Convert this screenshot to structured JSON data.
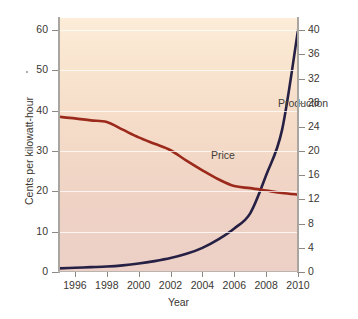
{
  "chart_data": {
    "type": "line",
    "title": "",
    "subtitle": "",
    "xlabel": "Year",
    "ylabel": "Cents per kilowatt-hour",
    "y2label": "Global solar power capacity (gigawatts)",
    "grid": "horizontal",
    "legend_position": "inline-annotation",
    "xlim": [
      1995,
      2010
    ],
    "ylim": [
      0,
      63
    ],
    "y2lim": [
      0,
      42
    ],
    "xticks": [
      1996,
      1998,
      2000,
      2002,
      2004,
      2006,
      2008,
      2010
    ],
    "xtick_labels": [
      "1996",
      "1998",
      "2000",
      "2002",
      "2004",
      "2006",
      "2008",
      "2010"
    ],
    "yticks": [
      0,
      10,
      20,
      30,
      40,
      50,
      60
    ],
    "ytick_labels": [
      "0",
      "10",
      "20",
      "30",
      "40",
      "50",
      "60"
    ],
    "y2ticks": [
      0,
      4,
      8,
      12,
      16,
      20,
      24,
      28,
      32,
      36,
      40
    ],
    "y2tick_labels": [
      "0",
      "4",
      "8",
      "12",
      "16",
      "20",
      "24",
      "28",
      "32",
      "36",
      "40"
    ],
    "x": [
      1995,
      1996,
      1997,
      1998,
      1999,
      2000,
      2001,
      2002,
      2003,
      2004,
      2005,
      2006,
      2007,
      2008,
      2009,
      2010
    ],
    "series": [
      {
        "name": "Price",
        "axis": "left",
        "units": "cents per kilowatt-hour",
        "color": "#9c2a1c",
        "values": [
          38.5,
          38.1,
          37.6,
          37.2,
          35.3,
          33.4,
          31.8,
          30.2,
          27.6,
          25.2,
          23.0,
          21.3,
          20.8,
          20.2,
          19.6,
          19.2
        ]
      },
      {
        "name": "Production",
        "axis": "right",
        "units": "gigawatts",
        "color": "#262044",
        "values": [
          0.6,
          0.7,
          0.8,
          0.9,
          1.1,
          1.4,
          1.8,
          2.3,
          3.0,
          4.0,
          5.4,
          7.2,
          9.7,
          16.0,
          23.5,
          40.0
        ]
      }
    ],
    "annotations": [
      {
        "text": "Price",
        "series": "Price",
        "x": 2001.4,
        "y": 30.5
      },
      {
        "text": "Production",
        "series": "Production",
        "x": 2005.6,
        "y2": 27.5
      }
    ],
    "colors": {
      "price_line": "#9c2a1c",
      "production_line": "#262044",
      "plot_bg_top": "#fcecd8",
      "plot_bg_bottom": "#ecd0c7",
      "gridline": "#ffffff",
      "axis": "#a9a5a0",
      "text": "#3b3732",
      "page_bg": "#ffffff"
    }
  }
}
